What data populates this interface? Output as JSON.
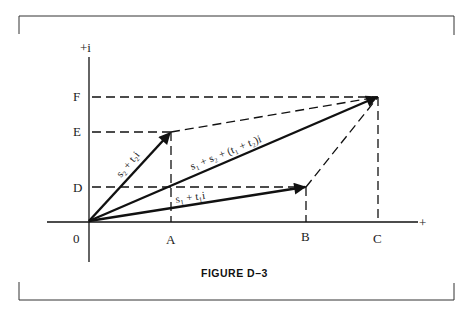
{
  "figure": {
    "caption": "FIGURE D–3",
    "axes": {
      "x_plus_label": "+",
      "y_plus_label": "+i",
      "origin_label": "0"
    },
    "x_ticks": [
      {
        "label": "A"
      },
      {
        "label": "B"
      },
      {
        "label": "C"
      }
    ],
    "y_ticks": [
      {
        "label": "D"
      },
      {
        "label": "E"
      },
      {
        "label": "F"
      }
    ],
    "vectors": [
      {
        "label": "s₂ + t₂i",
        "from": "0",
        "to": "(A, E)"
      },
      {
        "label": "s₁ + t₁i",
        "from": "0",
        "to": "(B, D)"
      },
      {
        "label": "s₁ + s₂ + (t₁ + t₂)i",
        "from": "0",
        "to": "(C, F)"
      }
    ],
    "colors": {
      "ink": "#111111",
      "background": "#ffffff"
    }
  }
}
